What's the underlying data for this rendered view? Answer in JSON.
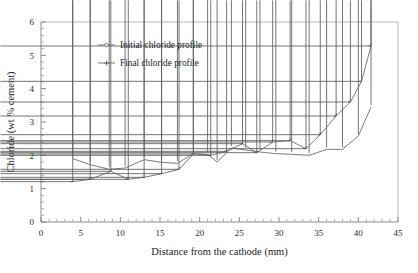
{
  "chart_data": {
    "type": "line",
    "title": "",
    "xlabel": "Distance from the cathode (mm)",
    "ylabel": "Chloride (wt % cement)",
    "xlim": [
      0,
      45
    ],
    "ylim": [
      0,
      6
    ],
    "xticks": [
      0,
      5,
      10,
      15,
      20,
      25,
      30,
      35,
      40,
      45
    ],
    "yticks": [
      0,
      1,
      2,
      3,
      4,
      5,
      6
    ],
    "xtick_labels": [
      "0",
      "5",
      "10",
      "15",
      "20",
      "25",
      "30",
      "35",
      "40",
      "45"
    ],
    "ytick_labels": [
      "0",
      "1",
      "2",
      "3",
      "4",
      "5",
      "6"
    ],
    "x_minor_tick_interval": 1,
    "y_minor_tick_interval": 0.2,
    "grid": false,
    "legend_position": "upper-left-inside",
    "series": [
      {
        "name": "Initial chloride profile",
        "marker": "diamond",
        "points": [
          [
            4.0,
            1.9
          ],
          [
            6.2,
            1.72
          ],
          [
            8.6,
            1.58
          ],
          [
            10.6,
            1.62
          ],
          [
            13.0,
            1.87
          ],
          [
            15.2,
            1.79
          ],
          [
            17.2,
            1.76
          ],
          [
            19.2,
            2.05
          ],
          [
            21.0,
            2.03
          ],
          [
            22.2,
            1.8
          ],
          [
            24.0,
            2.22
          ],
          [
            25.8,
            2.16
          ],
          [
            27.6,
            2.1
          ],
          [
            29.6,
            2.05
          ],
          [
            31.6,
            2.03
          ],
          [
            33.8,
            2.0
          ],
          [
            36.0,
            2.18
          ],
          [
            38.0,
            2.18
          ],
          [
            40.0,
            2.58
          ],
          [
            41.6,
            3.45
          ]
        ]
      },
      {
        "name": "Final chloride profile",
        "marker": "plus",
        "points": [
          [
            4.0,
            1.21
          ],
          [
            6.2,
            1.28
          ],
          [
            8.8,
            1.52
          ],
          [
            11.0,
            1.28
          ],
          [
            13.0,
            1.34
          ],
          [
            15.2,
            1.45
          ],
          [
            17.4,
            1.58
          ],
          [
            19.2,
            2.04
          ],
          [
            21.4,
            2.0
          ],
          [
            23.4,
            2.12
          ],
          [
            25.4,
            2.35
          ],
          [
            27.2,
            2.08
          ],
          [
            29.2,
            2.4
          ],
          [
            31.4,
            2.44
          ],
          [
            33.4,
            2.2
          ],
          [
            35.2,
            2.62
          ],
          [
            37.2,
            3.18
          ],
          [
            39.0,
            3.6
          ],
          [
            40.4,
            4.22
          ],
          [
            41.6,
            5.28
          ]
        ]
      }
    ]
  }
}
